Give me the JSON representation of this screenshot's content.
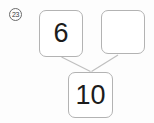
{
  "item_number": "23",
  "number_bond": {
    "type": "number-bond",
    "parts": [
      {
        "value": "6"
      },
      {
        "value": ""
      }
    ],
    "whole": {
      "value": "10"
    }
  },
  "colors": {
    "box_border": "#b3b3b3",
    "connector_line": "#bfbfbf",
    "digit_text": "#1c1c1c",
    "badge_outline": "#6b6b6b",
    "background": "#fdfdfd"
  }
}
